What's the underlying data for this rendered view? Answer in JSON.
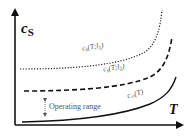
{
  "diagram": {
    "y_axis_label": {
      "main": "c",
      "sub": "S"
    },
    "x_axis_label": "T",
    "curves": [
      {
        "name": "cs(T;l1)",
        "label_main": "c",
        "label_sub": "s",
        "label_args": "(T;l",
        "label_idx": "1",
        "label_close": ")",
        "style": "dotted"
      },
      {
        "name": "cs(T;l2)",
        "label_main": "c",
        "label_sub": "s",
        "label_args": "(T;l",
        "label_idx": "2",
        "label_close": ")",
        "style": "dashed"
      },
      {
        "name": "c_inf(T)",
        "label_main": "c",
        "label_sub": "∞",
        "label_args": "(T)",
        "style": "solid"
      }
    ],
    "annotation": "Operating range",
    "colors": {
      "axis": "#111111",
      "curve": "#222222",
      "text": "#555555"
    }
  }
}
